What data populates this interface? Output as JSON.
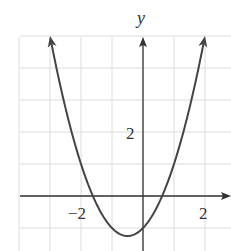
{
  "chart_data": {
    "type": "line",
    "title": "",
    "xlabel": "",
    "ylabel": "y",
    "equation": "y = x^2 + x - 1",
    "series": [
      {
        "name": "parabola",
        "x": [
          -3,
          -2.5,
          -2,
          -1.5,
          -1,
          -0.5,
          0,
          0.5,
          1,
          1.5,
          2
        ],
        "values": [
          5,
          2.75,
          1,
          -0.25,
          -1,
          -1.25,
          -1,
          -0.25,
          1,
          2.75,
          5
        ]
      }
    ],
    "vertex": [
      -0.5,
      -1.25
    ],
    "x_tick_labels": [
      {
        "value": -2,
        "label": "−2"
      },
      {
        "value": 2,
        "label": "2"
      }
    ],
    "y_tick_labels": [
      {
        "value": 2,
        "label": "2"
      }
    ],
    "xlim": [
      -4,
      2.8
    ],
    "ylim": [
      -1.7,
      5
    ],
    "grid": true,
    "grid_step": 1,
    "arrows": "both curve ends and positive axes",
    "legend": "none"
  },
  "labels": {
    "y_axis": "y",
    "x_neg2": "−2",
    "x_pos2": "2",
    "y_pos2": "2"
  },
  "colors": {
    "grid": "#dcdcdc",
    "axis": "#333333",
    "curve": "#444444"
  }
}
